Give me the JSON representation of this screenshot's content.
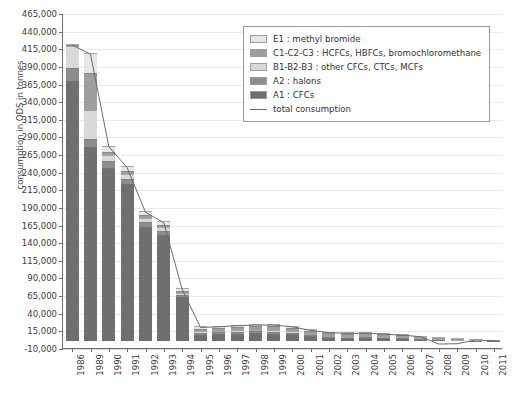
{
  "chart_data": {
    "type": "bar",
    "stacked": true,
    "title": "",
    "xlabel": "",
    "ylabel": "consumption in ODS in tonnes",
    "ylim": [
      -10000,
      465000
    ],
    "ystep": 25000,
    "grid": true,
    "legend_position": "top-right",
    "ytick_labels": [
      "465,000",
      "440,000",
      "415,000",
      "390,000",
      "365,000",
      "340,000",
      "315,000",
      "290,000",
      "265,000",
      "240,000",
      "215,000",
      "190,000",
      "165,000",
      "140,000",
      "115,000",
      "90,000",
      "65,000",
      "40,000",
      "15,000",
      "-10,000"
    ],
    "ytick_values": [
      465000,
      440000,
      415000,
      390000,
      365000,
      340000,
      315000,
      290000,
      265000,
      240000,
      215000,
      190000,
      165000,
      140000,
      115000,
      90000,
      65000,
      40000,
      15000,
      -10000
    ],
    "categories": [
      "1986",
      "1989",
      "1990",
      "1991",
      "1992",
      "1993",
      "1994",
      "1995",
      "1996",
      "1997",
      "1998",
      "1999",
      "2000",
      "2001",
      "2002",
      "2003",
      "2004",
      "2005",
      "2006",
      "2007",
      "2008",
      "2009",
      "2010",
      "2011"
    ],
    "series": [
      {
        "name": "A1 : CFCs",
        "color": "#6f6f6f",
        "values": [
          368000,
          275000,
          245000,
          222000,
          162000,
          150000,
          62000,
          9000,
          9500,
          10500,
          11000,
          10500,
          9500,
          6500,
          4500,
          4000,
          4500,
          4000,
          3500,
          2500,
          2000,
          1200,
          600,
          300
        ]
      },
      {
        "name": "A2 : halons",
        "color": "#8d8d8d",
        "values": [
          19000,
          12000,
          10000,
          8000,
          7000,
          6000,
          3000,
          2500,
          2500,
          2500,
          2500,
          2500,
          2000,
          1500,
          1200,
          1000,
          1000,
          900,
          800,
          600,
          400,
          300,
          200,
          100
        ]
      },
      {
        "name": "B1-B2-B3 : other CFCs, CTCs, MCFs",
        "color": "#d9d9d9",
        "values": [
          31000,
          40000,
          9000,
          7000,
          6000,
          5000,
          3500,
          2500,
          2500,
          2500,
          2500,
          2500,
          2000,
          1500,
          1200,
          1000,
          1000,
          900,
          800,
          600,
          400,
          300,
          200,
          100
        ]
      },
      {
        "name": "C1-C2-C3 : HCFCs, HBFCs, bromochloromethane",
        "color": "#9e9e9e",
        "values": [
          2000,
          53000,
          4000,
          3500,
          3500,
          3500,
          3000,
          3500,
          4000,
          4500,
          5000,
          5500,
          5500,
          5000,
          4500,
          4500,
          4500,
          4000,
          3500,
          3000,
          2500,
          2000,
          1500,
          1000
        ]
      },
      {
        "name": "E1 : methyl bromide",
        "color": "#e6e6e6",
        "values": [
          1000,
          28000,
          9000,
          7000,
          6000,
          5000,
          3000,
          3000,
          3000,
          3000,
          3000,
          3000,
          2500,
          2000,
          1800,
          1500,
          1500,
          1200,
          1000,
          800,
          600,
          400,
          300,
          200
        ]
      }
    ],
    "line_series": {
      "name": "total consumption",
      "color": "#6b6b6b",
      "values": [
        421000,
        408000,
        277000,
        247000,
        184000,
        169000,
        74500,
        20500,
        21500,
        23000,
        24000,
        24000,
        21500,
        16500,
        13200,
        12000,
        12500,
        11000,
        9600,
        7500,
        -3000,
        -2500,
        2800,
        1700
      ]
    }
  },
  "legend": {
    "items": [
      {
        "label": "E1 : methyl bromide",
        "color": "#e6e6e6",
        "kind": "swatch"
      },
      {
        "label": "C1-C2-C3 : HCFCs, HBFCs, bromochloromethane",
        "color": "#9e9e9e",
        "kind": "swatch"
      },
      {
        "label": "B1-B2-B3 : other CFCs, CTCs, MCFs",
        "color": "#d9d9d9",
        "kind": "swatch"
      },
      {
        "label": "A2 : halons",
        "color": "#8d8d8d",
        "kind": "swatch"
      },
      {
        "label": "A1 : CFCs",
        "color": "#6f6f6f",
        "kind": "swatch"
      },
      {
        "label": "total consumption",
        "color": "#6b6b6b",
        "kind": "line"
      }
    ]
  }
}
